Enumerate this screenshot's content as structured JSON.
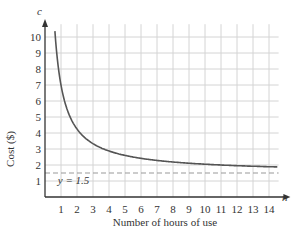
{
  "chart_data": {
    "type": "line",
    "title": "",
    "xlabel": "Number of hours of use",
    "ylabel": "Cost ($)",
    "x_axis_var": "n",
    "y_axis_var": "c",
    "xlim": [
      0,
      15
    ],
    "ylim": [
      0,
      11
    ],
    "x_ticks": [
      1,
      2,
      3,
      4,
      5,
      6,
      7,
      8,
      9,
      10,
      11,
      12,
      13,
      14
    ],
    "y_ticks": [
      1,
      2,
      3,
      4,
      5,
      6,
      7,
      8,
      9,
      10
    ],
    "grid": true,
    "series": [
      {
        "name": "cost curve",
        "x": [
          0.6,
          1,
          1.5,
          2,
          3,
          4,
          5,
          6,
          7,
          8,
          9,
          10,
          11,
          12,
          13,
          14.5
        ],
        "values": [
          10.7,
          7.0,
          5.17,
          4.25,
          3.33,
          2.88,
          2.6,
          2.42,
          2.29,
          2.19,
          2.11,
          2.05,
          2.0,
          1.96,
          1.92,
          1.88
        ],
        "color": "#555555"
      }
    ],
    "annotations": [
      {
        "type": "horizontal_dashed_line",
        "y": 1.5,
        "label": "y = 1.5",
        "color": "#999999"
      }
    ]
  }
}
